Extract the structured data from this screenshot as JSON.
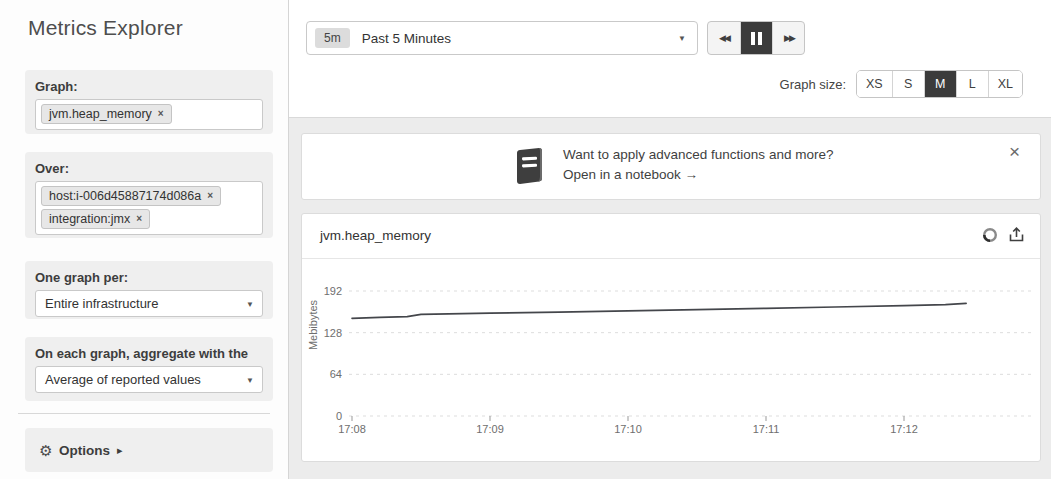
{
  "sidebar": {
    "title": "Metrics Explorer",
    "graph_label": "Graph:",
    "graph_tags": [
      {
        "text": "jvm.heap_memory"
      }
    ],
    "over_label": "Over:",
    "over_tags": [
      {
        "text": "host:i-006d45887174d086a"
      },
      {
        "text": "integration:jmx"
      }
    ],
    "one_graph_per_label": "One graph per:",
    "one_graph_per_value": "Entire infrastructure",
    "aggregate_label": "On each graph, aggregate with the",
    "aggregate_value": "Average of reported values",
    "options_label": "Options"
  },
  "toolbar": {
    "time_range_badge": "5m",
    "time_range_label": "Past 5 Minutes",
    "graph_size_label": "Graph size:",
    "graph_sizes": [
      "XS",
      "S",
      "M",
      "L",
      "XL"
    ],
    "graph_size_selected": "M"
  },
  "banner": {
    "line1": "Want to apply advanced functions and more?",
    "line2": "Open in a notebook →"
  },
  "chart": {
    "title": "jvm.heap_memory"
  },
  "icons": {
    "close": "×",
    "close_small": "×",
    "caret_down": "▼",
    "rewind": "◀◀",
    "forward": "▶▶",
    "gear": "⚙",
    "options_arrow": "▸"
  },
  "colors": {
    "accent_dark": "#3b3b3b",
    "line": "#44464b",
    "grid": "#dddddd",
    "tick_text": "#6e6e6e"
  },
  "chart_data": {
    "type": "line",
    "title": "jvm.heap_memory",
    "xlabel": "",
    "ylabel": "Mebibytes",
    "yticks": [
      0,
      64,
      128,
      192
    ],
    "ylim": [
      0,
      235
    ],
    "grid": "dashed-horizontal",
    "legend": "none",
    "xticks": [
      "17:08",
      "17:09",
      "17:10",
      "17:11",
      "17:12"
    ],
    "x_start": "17:08",
    "x_unit": "minutes_after_start",
    "series": [
      {
        "name": "jvm.heap_memory (avg)",
        "points": [
          [
            0.0,
            150
          ],
          [
            0.2,
            151.5
          ],
          [
            0.4,
            152.5
          ],
          [
            0.5,
            156
          ],
          [
            1.0,
            158
          ],
          [
            1.5,
            159.5
          ],
          [
            2.0,
            161.5
          ],
          [
            2.5,
            163.5
          ],
          [
            3.0,
            165.5
          ],
          [
            3.5,
            167.5
          ],
          [
            4.0,
            169.5
          ],
          [
            4.3,
            171
          ],
          [
            4.45,
            173
          ]
        ]
      }
    ]
  }
}
